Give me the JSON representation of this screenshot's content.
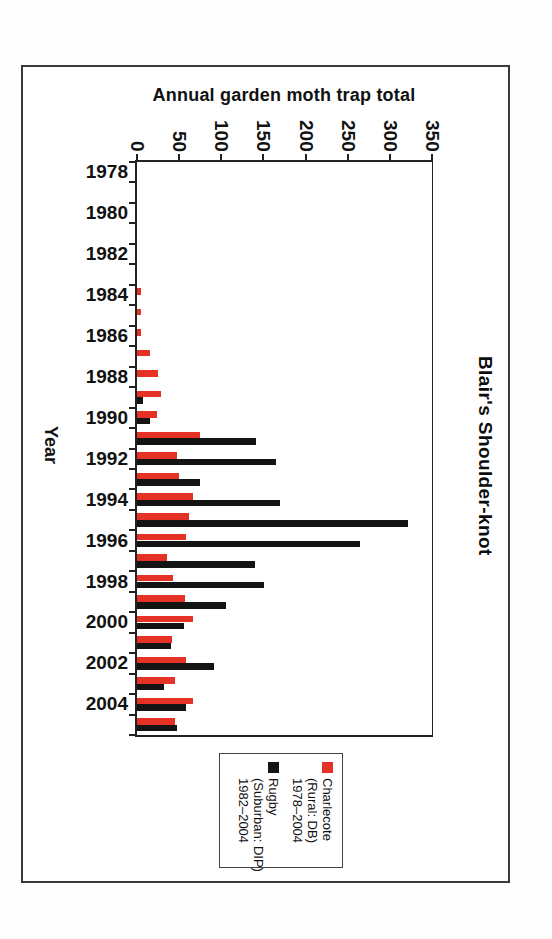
{
  "chart_data": {
    "type": "bar",
    "orientation": "rotated-90-clockwise",
    "title": "Blair's Shoulder-knot",
    "value_axis": {
      "label": "Annual garden moth trap total",
      "min": 0,
      "max": 350,
      "tick_step": 50,
      "ticks": [
        0,
        50,
        100,
        150,
        200,
        250,
        300,
        350
      ]
    },
    "category_axis": {
      "label": "Year",
      "start": 1978,
      "end": 2005,
      "labeled_ticks": [
        1978,
        1980,
        1982,
        1984,
        1986,
        1988,
        1990,
        1992,
        1994,
        1996,
        1998,
        2000,
        2002,
        2004
      ]
    },
    "categories": [
      1978,
      1979,
      1980,
      1981,
      1982,
      1983,
      1984,
      1985,
      1986,
      1987,
      1988,
      1989,
      1990,
      1991,
      1992,
      1993,
      1994,
      1995,
      1996,
      1997,
      1998,
      1999,
      2000,
      2001,
      2002,
      2003,
      2004,
      2005
    ],
    "series": [
      {
        "name": "Charlecote (Rural: DB) 1978–2004",
        "color": "#e63226",
        "values": [
          0,
          0,
          0,
          0,
          0,
          0,
          5,
          5,
          5,
          16,
          25,
          29,
          24,
          75,
          47,
          50,
          66,
          62,
          58,
          36,
          43,
          57,
          67,
          41,
          58,
          45,
          66,
          45
        ]
      },
      {
        "name": "Rugby (Suburban: DIP) 1982–2004",
        "color": "#141414",
        "values": [
          0,
          0,
          0,
          0,
          0,
          0,
          0,
          0,
          0,
          0,
          0,
          7,
          16,
          141,
          165,
          75,
          170,
          322,
          265,
          140,
          151,
          106,
          56,
          40,
          91,
          32,
          58,
          47
        ]
      }
    ],
    "legend": {
      "position": "bottom-rotated",
      "entries": [
        {
          "swatch_color": "#e63226",
          "lines": [
            "Charlecote",
            "(Rural: DB)",
            "1978–2004"
          ]
        },
        {
          "swatch_color": "#141414",
          "lines": [
            "Rugby",
            "(Suburban: DIP)",
            "1982–2004"
          ]
        }
      ]
    },
    "grid": "off",
    "plot_background": "#ffffff"
  }
}
